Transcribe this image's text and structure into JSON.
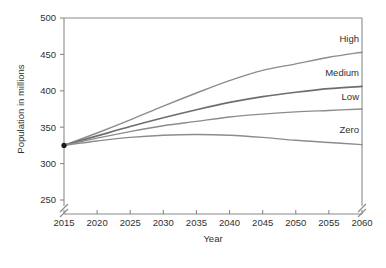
{
  "chart_data": {
    "type": "line",
    "title": "",
    "xlabel": "Year",
    "ylabel": "Population in millions",
    "xlim": [
      2015,
      2060
    ],
    "ylim": [
      250,
      500
    ],
    "xticks": [
      2015,
      2020,
      2025,
      2030,
      2035,
      2040,
      2045,
      2050,
      2055,
      2060
    ],
    "yticks": [
      250,
      300,
      350,
      400,
      450,
      500
    ],
    "grid": false,
    "legend_position": "inline-right",
    "axis_break": {
      "y_below": 250,
      "note": "break marks on both vertical axes below lowest tick"
    },
    "start_marker": {
      "x": 2015,
      "y": 325,
      "color": "#1a1a1a"
    },
    "x": [
      2015,
      2020,
      2025,
      2030,
      2035,
      2040,
      2045,
      2050,
      2055,
      2060
    ],
    "series": [
      {
        "name": "High",
        "label": "High",
        "color": "#8c8c8c",
        "values": [
          325,
          342,
          360,
          379,
          397,
          414,
          428,
          437,
          446,
          453
        ]
      },
      {
        "name": "Medium",
        "label": "Medium",
        "color": "#6e6e6e",
        "values": [
          325,
          338,
          351,
          363,
          374,
          384,
          392,
          398,
          403,
          406
        ]
      },
      {
        "name": "Low",
        "label": "Low",
        "color": "#8c8c8c",
        "values": [
          325,
          335,
          344,
          352,
          358,
          364,
          368,
          371,
          373,
          375
        ]
      },
      {
        "name": "Zero",
        "label": "Zero",
        "color": "#8c8c8c",
        "values": [
          325,
          331,
          336,
          339,
          340,
          339,
          336,
          332,
          329,
          326
        ]
      }
    ]
  },
  "axes": {
    "y_title": "Population in millions",
    "x_title": "Year",
    "y_tick_labels": [
      "500",
      "450",
      "400",
      "350",
      "300",
      "250"
    ],
    "x_tick_labels": [
      "2015",
      "2020",
      "2025",
      "2030",
      "2035",
      "2040",
      "2045",
      "2050",
      "2055",
      "2060"
    ]
  },
  "series_labels": {
    "high": "High",
    "medium": "Medium",
    "low": "Low",
    "zero": "Zero"
  },
  "colors": {
    "axis": "#8a8a8a",
    "text": "#2f2f2f",
    "line_light": "#8c8c8c",
    "line_dark": "#6e6e6e",
    "marker": "#1a1a1a",
    "background": "#ffffff"
  }
}
